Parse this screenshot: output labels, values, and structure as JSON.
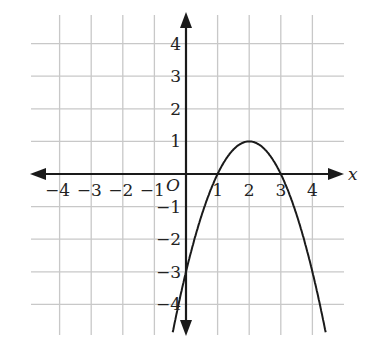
{
  "chart_data": {
    "type": "line",
    "title": "",
    "xlabel": "x",
    "ylabel": "",
    "origin_label": "O",
    "xlim": [
      -4.5,
      4.5
    ],
    "ylim": [
      -4.5,
      4.5
    ],
    "grid": true,
    "x_ticks": [
      -4,
      -3,
      -2,
      -1,
      1,
      2,
      3,
      4
    ],
    "y_ticks": [
      4,
      3,
      2,
      1,
      -1,
      -2,
      -3,
      -4
    ],
    "x_tick_labels": [
      "−4",
      "−3",
      "−2",
      "−1",
      "1",
      "2",
      "3",
      "4"
    ],
    "y_tick_labels": [
      "4",
      "3",
      "2",
      "1",
      "−1",
      "−2",
      "−3",
      "−4"
    ],
    "series": [
      {
        "name": "parabola",
        "equation": "y = -(x-2)^2 + 1",
        "vertex": [
          2,
          1
        ],
        "x_intercepts": [
          1,
          3
        ],
        "y_intercept": -3,
        "x": [
          -0.4,
          0,
          0.5,
          1,
          1.5,
          2,
          2.5,
          3,
          3.5,
          4,
          4.4
        ],
        "y": [
          -4.76,
          -3,
          -1.25,
          0,
          0.75,
          1,
          0.75,
          0,
          -1.25,
          -3,
          -4.76
        ]
      }
    ]
  }
}
